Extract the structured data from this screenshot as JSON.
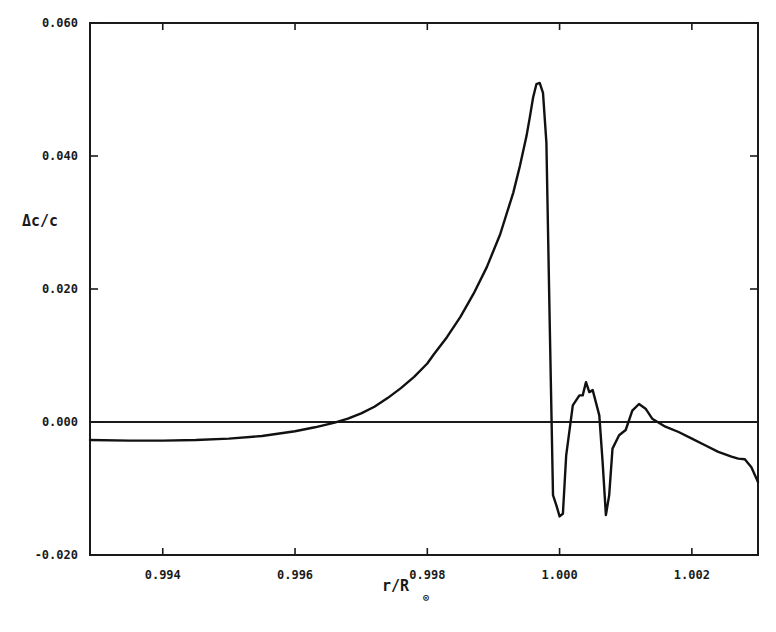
{
  "chart_data": {
    "type": "line",
    "title": "",
    "xlabel": "r/R",
    "xlabel_subscript": "⊙",
    "ylabel": "Δc/c",
    "xlim": [
      0.9929,
      1.003
    ],
    "ylim": [
      -0.02,
      0.06
    ],
    "grid": false,
    "legend": null,
    "x_ticks": [
      0.994,
      0.996,
      0.998,
      1.0,
      1.002
    ],
    "x_tick_labels": [
      "0.994",
      "0.996",
      "0.998",
      "1.000",
      "1.002"
    ],
    "y_ticks": [
      0.06,
      0.04,
      0.02,
      0.0,
      -0.02
    ],
    "y_tick_labels": [
      "0.060",
      "0.040",
      "0.020",
      "0.000",
      "-0.020"
    ],
    "reference_lines": [
      {
        "axis": "y",
        "value": 0.0
      }
    ],
    "series": [
      {
        "name": "Δc/c",
        "x": [
          0.9929,
          0.9935,
          0.994,
          0.9945,
          0.995,
          0.9955,
          0.996,
          0.9963,
          0.9966,
          0.9968,
          0.997,
          0.9972,
          0.9974,
          0.9976,
          0.9978,
          0.998,
          0.9981,
          0.9983,
          0.9985,
          0.9987,
          0.9989,
          0.9991,
          0.9993,
          0.9994,
          0.9995,
          0.99955,
          0.9996,
          0.99965,
          0.9997,
          0.99975,
          0.9998,
          0.99985,
          0.9999,
          0.99995,
          1.0,
          1.00005,
          1.0001,
          1.0002,
          1.0003,
          1.00035,
          1.0004,
          1.00045,
          1.0005,
          1.0006,
          1.00065,
          1.0007,
          1.00075,
          1.0008,
          1.0009,
          1.001,
          1.0011,
          1.0012,
          1.0013,
          1.0014,
          1.0016,
          1.0018,
          1.002,
          1.0022,
          1.0024,
          1.0026,
          1.0027,
          1.0028,
          1.0029,
          1.003
        ],
        "y": [
          -0.0027,
          -0.0028,
          -0.0028,
          -0.0027,
          -0.0025,
          -0.0021,
          -0.0014,
          -0.0008,
          -0.0001,
          0.0005,
          0.0013,
          0.0023,
          0.0036,
          0.0051,
          0.0068,
          0.0088,
          0.0102,
          0.0128,
          0.0158,
          0.0193,
          0.0233,
          0.0282,
          0.0345,
          0.0385,
          0.043,
          0.0458,
          0.0488,
          0.0508,
          0.051,
          0.0495,
          0.042,
          0.015,
          -0.011,
          -0.0125,
          -0.0142,
          -0.0138,
          -0.005,
          0.0025,
          0.004,
          0.004,
          0.006,
          0.0045,
          0.0048,
          0.001,
          -0.006,
          -0.014,
          -0.011,
          -0.004,
          -0.002,
          -0.0012,
          0.0017,
          0.0027,
          0.002,
          0.0005,
          -0.0007,
          -0.0015,
          -0.0025,
          -0.0035,
          -0.0045,
          -0.0052,
          -0.0055,
          -0.0056,
          -0.0068,
          -0.009
        ]
      }
    ]
  }
}
